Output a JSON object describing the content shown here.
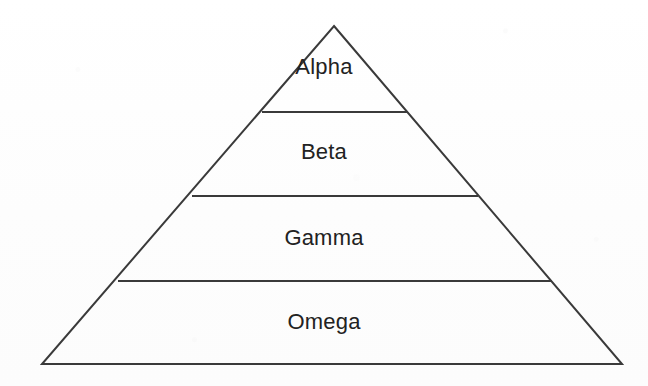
{
  "diagram": {
    "type": "pyramid",
    "shape_name": "triangle-outline",
    "background_color": "#fdfdfd",
    "stroke_color": "#3a3a3a",
    "fill_color": "none",
    "text_color": "#222222",
    "stroke_width": 2,
    "apex": {
      "x": 334,
      "y": 26
    },
    "base_left": {
      "x": 42,
      "y": 364
    },
    "base_right": {
      "x": 622,
      "y": 364
    },
    "tiers": [
      {
        "label": "Alpha",
        "level": 1,
        "position": "top",
        "label_x": 334,
        "label_y": 67,
        "divider_below": {
          "y": 112,
          "x1": 262,
          "x2": 407
        }
      },
      {
        "label": "Beta",
        "level": 2,
        "position": "second",
        "label_x": 334,
        "label_y": 152,
        "divider_below": {
          "y": 196,
          "x1": 192,
          "x2": 478
        }
      },
      {
        "label": "Gamma",
        "level": 3,
        "position": "third",
        "label_x": 334,
        "label_y": 238,
        "divider_below": {
          "y": 281,
          "x1": 118,
          "x2": 552
        }
      },
      {
        "label": "Omega",
        "level": 4,
        "position": "base",
        "label_x": 334,
        "label_y": 322,
        "divider_below": null
      }
    ]
  }
}
